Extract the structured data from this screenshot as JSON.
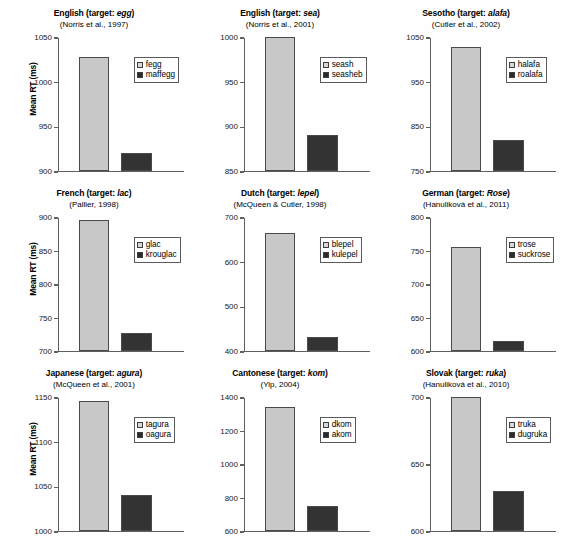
{
  "figure": {
    "ylabel": "Mean RT (ms)",
    "light_color": "#c8c8c8",
    "dark_color": "#333333"
  },
  "chart_data": [
    {
      "type": "bar",
      "title_lang": "English",
      "title_prefix": "English (target: ",
      "title_target": "egg",
      "title_suffix": ")",
      "citation": "(Norris et al., 1997)",
      "categories": [
        "fegg",
        "maffegg"
      ],
      "values": [
        1027,
        920
      ],
      "ylabel": "Mean RT (ms)",
      "xlabel": "",
      "ylim": [
        900,
        1050
      ],
      "yticks": [
        900,
        950,
        1000,
        1050
      ],
      "ytick_labels": [
        "900",
        "950",
        "1000",
        "1050"
      ],
      "grid": false,
      "legend_position": "top-right",
      "legend": [
        "fegg",
        "maffegg"
      ]
    },
    {
      "type": "bar",
      "title_lang": "English",
      "title_prefix": "English (target: ",
      "title_target": "sea",
      "title_suffix": ")",
      "citation": "(Norris et al., 2001)",
      "categories": [
        "seash",
        "seasheb"
      ],
      "values": [
        1000,
        890
      ],
      "ylabel": "",
      "xlabel": "",
      "ylim": [
        850,
        1000
      ],
      "yticks": [
        850,
        900,
        950,
        1000
      ],
      "ytick_labels": [
        "850",
        "900",
        "950",
        "1000"
      ],
      "grid": false,
      "legend_position": "top-right",
      "legend": [
        "seash",
        "seasheb"
      ]
    },
    {
      "type": "bar",
      "title_lang": "Sesotho",
      "title_prefix": "Sesotho (target: ",
      "title_target": "alafa",
      "title_suffix": ")",
      "citation": "(Cutler et al., 2002)",
      "categories": [
        "halafa",
        "roalafa"
      ],
      "values": [
        1028,
        818
      ],
      "ylabel": "",
      "xlabel": "",
      "ylim": [
        750,
        1050
      ],
      "yticks": [
        750,
        850,
        950,
        1050
      ],
      "ytick_labels": [
        "750",
        "850",
        "950",
        "1050"
      ],
      "grid": false,
      "legend_position": "top-right",
      "legend": [
        "halafa",
        "roalafa"
      ]
    },
    {
      "type": "bar",
      "title_lang": "French",
      "title_prefix": "French (target: ",
      "title_target": "lac",
      "title_suffix": ")",
      "citation": "(Pallier, 1998)",
      "categories": [
        "glac",
        "krouglac"
      ],
      "values": [
        896,
        727
      ],
      "ylabel": "Mean RT (ms)",
      "xlabel": "",
      "ylim": [
        700,
        900
      ],
      "yticks": [
        700,
        750,
        800,
        850,
        900
      ],
      "ytick_labels": [
        "700",
        "750",
        "800",
        "850",
        "900"
      ],
      "grid": false,
      "legend_position": "top-right",
      "legend": [
        "glac",
        "krouglac"
      ]
    },
    {
      "type": "bar",
      "title_lang": "Dutch",
      "title_prefix": "Dutch (target: ",
      "title_target": "lepel",
      "title_suffix": ")",
      "citation": "(McQueen & Cutler, 1998)",
      "categories": [
        "blepel",
        "kulepel"
      ],
      "values": [
        663,
        432
      ],
      "ylabel": "",
      "xlabel": "",
      "ylim": [
        400,
        700
      ],
      "yticks": [
        400,
        500,
        600,
        700
      ],
      "ytick_labels": [
        "400",
        "500",
        "600",
        "700"
      ],
      "grid": false,
      "legend_position": "top-right",
      "legend": [
        "blepel",
        "kulepel"
      ]
    },
    {
      "type": "bar",
      "title_lang": "German",
      "title_prefix": "German (target: ",
      "title_target": "Rose",
      "title_suffix": ")",
      "citation": "(Hanuliková et al., 2011)",
      "categories": [
        "trose",
        "suckrose"
      ],
      "values": [
        755,
        615
      ],
      "ylabel": "",
      "xlabel": "",
      "ylim": [
        600,
        800
      ],
      "yticks": [
        600,
        650,
        700,
        750,
        800
      ],
      "ytick_labels": [
        "600",
        "650",
        "700",
        "750",
        "800"
      ],
      "grid": false,
      "legend_position": "top-right",
      "legend": [
        "trose",
        "suckrose"
      ]
    },
    {
      "type": "bar",
      "title_lang": "Japanese",
      "title_prefix": "Japanese (target: ",
      "title_target": "agura",
      "title_suffix": ")",
      "citation": "(McQueen et al., 2001)",
      "categories": [
        "tagura",
        "oagura"
      ],
      "values": [
        1145,
        1040
      ],
      "ylabel": "Mean RT (ms)",
      "xlabel": "",
      "ylim": [
        1000,
        1150
      ],
      "yticks": [
        1000,
        1050,
        1100,
        1150
      ],
      "ytick_labels": [
        "1000",
        "1050",
        "1100",
        "1150"
      ],
      "grid": false,
      "legend_position": "top-right",
      "legend": [
        "tagura",
        "oagura"
      ]
    },
    {
      "type": "bar",
      "title_lang": "Cantonese",
      "title_prefix": "Cantonese (target: ",
      "title_target": "kom",
      "title_suffix": ")",
      "citation": "(Yip, 2004)",
      "categories": [
        "dkom",
        "akom"
      ],
      "values": [
        1340,
        750
      ],
      "ylabel": "",
      "xlabel": "",
      "ylim": [
        600,
        1400
      ],
      "yticks": [
        600,
        800,
        1000,
        1200,
        1400
      ],
      "ytick_labels": [
        "600",
        "800",
        "1000",
        "1200",
        "1400"
      ],
      "grid": false,
      "legend_position": "top-right",
      "legend": [
        "dkom",
        "akom"
      ]
    },
    {
      "type": "bar",
      "title_lang": "Slovak",
      "title_prefix": "Slovak (target: ",
      "title_target": "ruka",
      "title_suffix": ")",
      "citation": "(Hanuliková et al., 2010)",
      "categories": [
        "truka",
        "dugruka"
      ],
      "values": [
        700,
        630
      ],
      "ylabel": "",
      "xlabel": "",
      "ylim": [
        600,
        700
      ],
      "yticks": [
        600,
        650,
        700
      ],
      "ytick_labels": [
        "600",
        "650",
        "700"
      ],
      "grid": false,
      "legend_position": "top-right",
      "legend": [
        "truka",
        "dugruka"
      ]
    }
  ]
}
